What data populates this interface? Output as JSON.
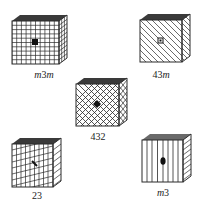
{
  "figure": {
    "cubes": [
      {
        "id": "m3m",
        "label": "m3m",
        "label_parts": [
          {
            "t": "m",
            "i": true
          },
          {
            "t": "3",
            "i": false
          },
          {
            "t": "m",
            "i": true
          }
        ],
        "pattern": "square-grid",
        "center_mark": "square"
      },
      {
        "id": "43m",
        "label": "43m",
        "label_parts": [
          {
            "t": "43",
            "i": false
          },
          {
            "t": "m",
            "i": true
          }
        ],
        "pattern": "diagonal-lines",
        "center_mark": "small-square"
      },
      {
        "id": "432",
        "label": "432",
        "label_parts": [
          {
            "t": "432",
            "i": false
          }
        ],
        "pattern": "diamond-crosshatch",
        "center_mark": "diamond"
      },
      {
        "id": "23",
        "label": "23",
        "label_parts": [
          {
            "t": "23",
            "i": false
          }
        ],
        "pattern": "vertical-plus-slanted",
        "center_mark": "arrow"
      },
      {
        "id": "m3",
        "label": "m3",
        "label_parts": [
          {
            "t": "m",
            "i": true
          },
          {
            "t": "3",
            "i": false
          }
        ],
        "pattern": "vertical-lines",
        "center_mark": "ellipse"
      }
    ]
  },
  "colors": {
    "line": "#2a2a2a",
    "top_face": "#3a3a3a",
    "background": "#ffffff"
  }
}
